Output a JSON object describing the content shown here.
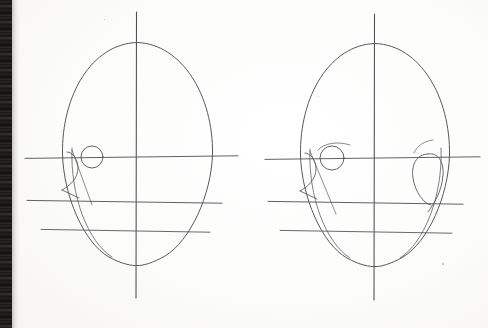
{
  "image": {
    "title": "Pencil construction drawing — two front-view head studies",
    "medium": "graphite pencil on white paper",
    "capture": "flatbed scan",
    "width": 488,
    "height": 328,
    "background_color": "#fbfbfa",
    "line_color": "#58585c",
    "scanner_edge_color": "#13110f"
  },
  "figures": [
    {
      "id": "head-left",
      "label": "left head construction study",
      "view": "front view",
      "centerline": {
        "x": 136,
        "y_top": 12,
        "y_bottom": 298
      },
      "cranium": {
        "top_y": 42,
        "left_x": 62,
        "right_x": 213,
        "widest_y": 150
      },
      "jaw": {
        "chin_y": 265,
        "chin_x": 137
      },
      "guidelines": [
        {
          "name": "brow-eye-line",
          "y": 157,
          "x_start": 25,
          "x_end": 238
        },
        {
          "name": "nose-line",
          "y": 199,
          "x_start": 27,
          "x_end": 222
        },
        {
          "name": "mouth-line",
          "y": 228,
          "x_start": 41,
          "x_end": 210
        }
      ],
      "eyes": [
        {
          "name": "left-eye-circle",
          "cx": 92,
          "cy": 157,
          "r": 11
        }
      ],
      "nose_wedge": {
        "apex_x": 76,
        "apex_y": 150,
        "base_y": 199
      },
      "ear": null
    },
    {
      "id": "head-right",
      "label": "right head construction study",
      "view": "front view",
      "centerline": {
        "x": 374,
        "y_top": 14,
        "y_bottom": 300
      },
      "cranium": {
        "top_y": 43,
        "left_x": 300,
        "right_x": 450,
        "widest_y": 150
      },
      "jaw": {
        "chin_y": 266,
        "chin_x": 375
      },
      "guidelines": [
        {
          "name": "brow-eye-line",
          "y": 158,
          "x_start": 265,
          "x_end": 480
        },
        {
          "name": "nose-line",
          "y": 200,
          "x_start": 268,
          "x_end": 463
        },
        {
          "name": "mouth-line",
          "y": 229,
          "x_start": 280,
          "x_end": 452
        }
      ],
      "eyes": [
        {
          "name": "left-eye-circle",
          "cx": 332,
          "cy": 158,
          "r": 12
        }
      ],
      "nose_wedge": {
        "apex_x": 314,
        "apex_y": 151,
        "base_y": 200
      },
      "ear": {
        "name": "right-ear-oval",
        "cx": 428,
        "cy": 180,
        "rx": 15,
        "ry": 26
      }
    }
  ],
  "marks": [
    {
      "name": "paper-speck",
      "x": 442,
      "y": 263,
      "size": 2
    },
    {
      "name": "paper-speck",
      "x": 104,
      "y": 19,
      "size": 1
    },
    {
      "name": "paper-speck",
      "x": 318,
      "y": 96,
      "size": 1
    }
  ]
}
